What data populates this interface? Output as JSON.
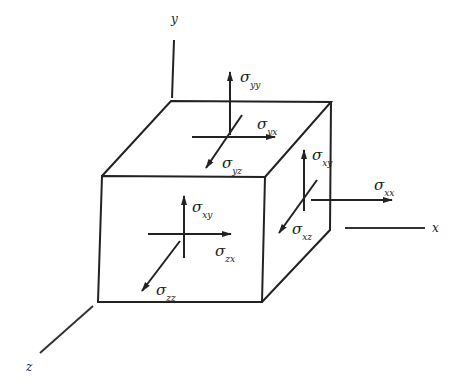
{
  "diagram": {
    "title": "",
    "type": "3D stress element (cube) with stress components",
    "colors": {
      "line": "#222222",
      "background": "#ffffff"
    },
    "axes": [
      {
        "name": "y",
        "label": "y"
      },
      {
        "name": "x",
        "label": "x"
      },
      {
        "name": "z",
        "label": "z"
      }
    ],
    "stresses": {
      "yy": {
        "symbol": "σ",
        "sub": "yy",
        "face": "top",
        "direction": "up"
      },
      "yx": {
        "symbol": "σ",
        "sub": "yx",
        "face": "top",
        "direction": "+x"
      },
      "yz": {
        "symbol": "σ",
        "sub": "yz",
        "face": "top",
        "direction": "+z"
      },
      "xy": {
        "symbol": "σ",
        "sub": "xy",
        "face": "right",
        "direction": "up"
      },
      "xx": {
        "symbol": "σ",
        "sub": "xx",
        "face": "right",
        "direction": "+x"
      },
      "xz": {
        "symbol": "σ",
        "sub": "xz",
        "face": "right",
        "direction": "+z"
      },
      "zy": {
        "symbol": "σ",
        "sub": "xy",
        "face": "front",
        "direction": "up"
      },
      "zx": {
        "symbol": "σ",
        "sub": "zx",
        "face": "front",
        "direction": "+x"
      },
      "zz": {
        "symbol": "σ",
        "sub": "zz",
        "face": "front",
        "direction": "+z"
      }
    }
  }
}
